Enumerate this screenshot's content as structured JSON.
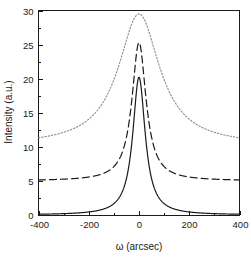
{
  "chart_data": {
    "type": "line",
    "title": "",
    "xlabel": "ω (arcsec)",
    "ylabel": "Intensity (a.u.)",
    "xlim": [
      -400,
      400
    ],
    "ylim": [
      0,
      30
    ],
    "xticks": [
      -400,
      -200,
      0,
      200,
      400
    ],
    "xtick_labels": [
      "-400",
      "-200",
      "0",
      "200",
      "400"
    ],
    "yticks": [
      0,
      5,
      10,
      15,
      20,
      25,
      30
    ],
    "ytick_labels": [
      "0",
      "5",
      "10",
      "15",
      "20",
      "25",
      "30"
    ],
    "grid": false,
    "legend": null,
    "legend_position": "none",
    "series": [
      {
        "name": "solid",
        "style": "solid",
        "color": "#1a1a1a",
        "peak": 20.2,
        "baseline": 0.0,
        "hwhm": 30,
        "shape": "lorentzian",
        "center": 0
      },
      {
        "name": "dashed",
        "style": "dashed",
        "color": "#1a1a1a",
        "peak": 25.3,
        "baseline": 5.0,
        "hwhm": 34,
        "shape": "lorentzian",
        "center": 0
      },
      {
        "name": "dotted",
        "style": "dotted",
        "color": "#8a8a8a",
        "peak": 29.5,
        "baseline": 10.2,
        "hwhm": 100,
        "shape": "lorentzian",
        "center": 0
      }
    ]
  },
  "axes": {
    "x_title": "ω (arcsec)",
    "y_title": "Intensity (a.u.)"
  }
}
